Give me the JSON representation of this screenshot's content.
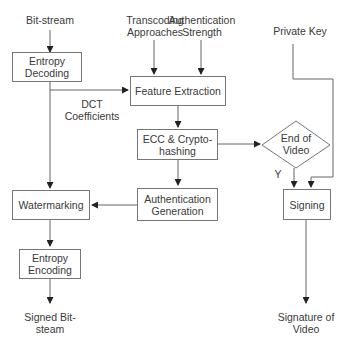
{
  "inputs": {
    "bitstream": "Bit-stream",
    "transcoding": [
      "Transcoding",
      "Approaches"
    ],
    "auth_strength": [
      "Authentication",
      "Strength"
    ],
    "private_key": "Private Key"
  },
  "boxes": {
    "entropy_decoding": [
      "Entropy",
      "Decoding"
    ],
    "feature_extraction": "Feature Extraction",
    "ecc_hashing": [
      "ECC & Crypto-",
      "hashing"
    ],
    "auth_generation": [
      "Authentication",
      "Generation"
    ],
    "watermarking": "Watermarking",
    "entropy_encoding": [
      "Entropy",
      "Encoding"
    ],
    "signing": "Signing"
  },
  "decision": {
    "label": [
      "End of",
      "Video"
    ],
    "yes_label": "Y"
  },
  "edge_labels": {
    "dct": [
      "DCT",
      "Coefficients"
    ]
  },
  "outputs": {
    "signed_bitstream": [
      "Signed Bit-",
      "steam"
    ],
    "signature": [
      "Signature of",
      "Video"
    ]
  }
}
